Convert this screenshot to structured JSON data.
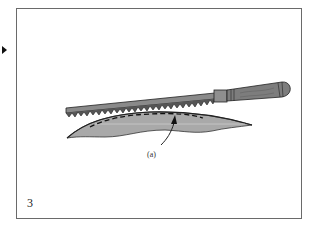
{
  "figure": {
    "step_number": "3",
    "callout_label": "(a)",
    "pointer": "triangle-right",
    "colors": {
      "frame": "#6a6a6a",
      "blade": "#8a8a8a",
      "handle": "#7d7d7d",
      "leaf_fill": "#a9a9a9",
      "outline": "#222222"
    },
    "elements": [
      "saw-blade-with-teeth",
      "wooden-handle",
      "shaded-leaf-shape",
      "dashed-cut-line",
      "callout-arrow"
    ]
  }
}
